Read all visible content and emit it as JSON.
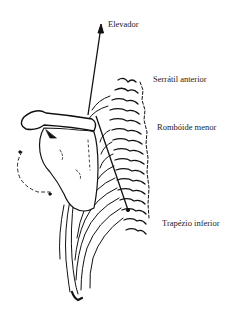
{
  "figure": {
    "colors": {
      "ink": "#111111",
      "background": "#ffffff"
    }
  },
  "labels": {
    "elevador": "Elevador",
    "serratil_anterior": "Serrátil anterior",
    "romboide_menor": "Rombóide menor",
    "trapezio_inferior": "Trapézio inferior"
  },
  "vectors": [
    {
      "name": "elevador",
      "from": [
        88,
        115
      ],
      "to": [
        101,
        25
      ]
    },
    {
      "name": "trapezio_inferior",
      "from": [
        96,
        116
      ],
      "to": [
        128,
        210
      ]
    }
  ]
}
